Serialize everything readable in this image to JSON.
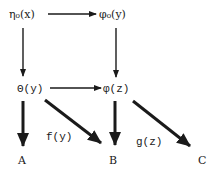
{
  "diagram": {
    "nodes": {
      "eta0": "η₀(x)",
      "phi0": "φ₀(y)",
      "theta": "Θ(y)",
      "phi": "φ(z)",
      "A": "A",
      "B": "B",
      "C": "C"
    },
    "edge_labels": {
      "f": "f(y)",
      "g": "g(z)"
    },
    "edges": [
      {
        "from": "eta0",
        "to": "phi0",
        "style": "thin"
      },
      {
        "from": "eta0",
        "to": "theta",
        "style": "thin"
      },
      {
        "from": "phi0",
        "to": "phi",
        "style": "thin"
      },
      {
        "from": "theta",
        "to": "phi",
        "style": "thin"
      },
      {
        "from": "theta",
        "to": "A",
        "style": "thick"
      },
      {
        "from": "theta",
        "to": "B",
        "style": "thick",
        "label": "f(y)"
      },
      {
        "from": "phi",
        "to": "B",
        "style": "thick"
      },
      {
        "from": "phi",
        "to": "C",
        "style": "thick",
        "label": "g(z)"
      }
    ],
    "colors": {
      "ink": "#1a1a1a",
      "background": "#ffffff"
    }
  }
}
